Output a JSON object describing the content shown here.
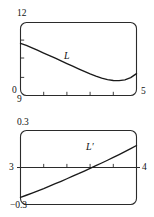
{
  "figure": {
    "background_color": "#ffffff",
    "line_color": "#1a1a1a",
    "panels": [
      "top",
      "bottom"
    ]
  },
  "chart_data": [
    {
      "panel": "top",
      "type": "line",
      "title": "",
      "xlabel": "",
      "ylabel": "",
      "xlim": [
        9,
        5
      ],
      "ylim": [
        0,
        12
      ],
      "x_tick_labels": [
        "9",
        "5"
      ],
      "y_tick_labels": [
        "0",
        "12"
      ],
      "grid": false,
      "legend": "none",
      "annotations": [
        {
          "text": "L",
          "x": 0.385,
          "y": 0.46,
          "style": "italic"
        }
      ],
      "series": [
        {
          "name": "L",
          "points": [
            [
              0.0,
              0.715
            ],
            [
              0.05,
              0.685
            ],
            [
              0.1,
              0.652
            ],
            [
              0.15,
              0.617
            ],
            [
              0.2,
              0.582
            ],
            [
              0.25,
              0.547
            ],
            [
              0.3,
              0.511
            ],
            [
              0.35,
              0.474
            ],
            [
              0.4,
              0.438
            ],
            [
              0.45,
              0.402
            ],
            [
              0.5,
              0.366
            ],
            [
              0.55,
              0.33
            ],
            [
              0.6,
              0.296
            ],
            [
              0.65,
              0.266
            ],
            [
              0.7,
              0.239
            ],
            [
              0.75,
              0.218
            ],
            [
              0.8,
              0.205
            ],
            [
              0.85,
              0.203
            ],
            [
              0.9,
              0.215
            ],
            [
              0.95,
              0.245
            ],
            [
              1.0,
              0.3
            ]
          ]
        }
      ]
    },
    {
      "panel": "bottom",
      "type": "line",
      "title": "",
      "xlabel": "",
      "ylabel": "",
      "xlim": [
        3,
        4
      ],
      "ylim": [
        -0.3,
        0.3
      ],
      "x_tick_labels": [
        "3",
        "4"
      ],
      "y_tick_labels": [
        "-0.3",
        "0.3"
      ],
      "grid": false,
      "legend": "none",
      "zero_line": true,
      "annotations": [
        {
          "text": "L'",
          "x": 0.6,
          "y": 0.66,
          "style": "italic"
        }
      ],
      "series": [
        {
          "name": "L-prime",
          "points": [
            [
              0.0,
              0.095
            ],
            [
              0.05,
              0.125
            ],
            [
              0.1,
              0.155
            ],
            [
              0.15,
              0.185
            ],
            [
              0.2,
              0.215
            ],
            [
              0.25,
              0.248
            ],
            [
              0.3,
              0.281
            ],
            [
              0.35,
              0.314
            ],
            [
              0.4,
              0.348
            ],
            [
              0.45,
              0.382
            ],
            [
              0.5,
              0.416
            ],
            [
              0.55,
              0.452
            ],
            [
              0.6,
              0.488
            ],
            [
              0.65,
              0.524
            ],
            [
              0.7,
              0.561
            ],
            [
              0.75,
              0.598
            ],
            [
              0.8,
              0.636
            ],
            [
              0.85,
              0.675
            ],
            [
              0.9,
              0.714
            ],
            [
              0.95,
              0.755
            ],
            [
              1.0,
              0.797
            ]
          ]
        }
      ]
    }
  ],
  "top_panel": {
    "y_max_label": "12",
    "y_min_label": "0",
    "x_min_label": "9",
    "x_max_label": "5",
    "curve_label": "L"
  },
  "bottom_panel": {
    "y_max_label": "0.3",
    "y_min_label": "−0.3",
    "x_min_label": "3",
    "x_max_label": "4",
    "curve_label": "L′"
  }
}
